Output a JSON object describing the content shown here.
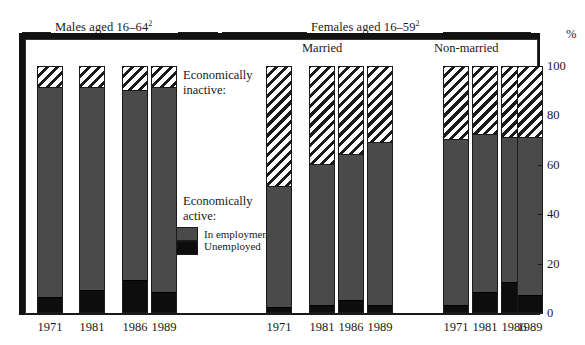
{
  "chart_data": {
    "type": "bar",
    "subtitle": "",
    "xlabel": "",
    "ylabel": "%",
    "ylim": [
      0,
      100
    ],
    "grid": false,
    "stacked": true,
    "legend_position": "inside-left",
    "y_ticks": [
      0,
      20,
      40,
      60,
      80,
      100
    ],
    "y_tick_labels": [
      "0",
      "20",
      "40",
      "60",
      "80",
      "100"
    ],
    "groups": [
      {
        "name": "Males aged 16–64",
        "footnote": "2",
        "label": "Males aged 16–64",
        "subgroups": [
          {
            "name": "",
            "categories": [
              "1971",
              "1981",
              "1986",
              "1989"
            ],
            "series": [
              {
                "name": "Unemployed",
                "values": [
                  6,
                  9,
                  13,
                  8
                ]
              },
              {
                "name": "In employment",
                "values": [
                  85,
                  82,
                  77,
                  83
                ]
              },
              {
                "name": "Economically inactive",
                "values": [
                  9,
                  9,
                  10,
                  9
                ]
              }
            ]
          }
        ]
      },
      {
        "name": "Females aged 16–59",
        "footnote": "2",
        "label": "Females aged 16–59",
        "subgroups": [
          {
            "name": "Married",
            "categories": [
              "1971",
              "1981",
              "1986",
              "1989"
            ],
            "series": [
              {
                "name": "Unemployed",
                "values": [
                  2,
                  3,
                  5,
                  3
                ]
              },
              {
                "name": "In employment",
                "values": [
                  49,
                  57,
                  59,
                  66
                ]
              },
              {
                "name": "Economically inactive",
                "values": [
                  49,
                  40,
                  36,
                  31
                ]
              }
            ]
          },
          {
            "name": "Non-married",
            "categories": [
              "1971",
              "1981",
              "1986",
              "1989"
            ],
            "series": [
              {
                "name": "Unemployed",
                "values": [
                  3,
                  8,
                  12,
                  7
                ]
              },
              {
                "name": "In employment",
                "values": [
                  67,
                  64,
                  59,
                  64
                ]
              },
              {
                "name": "Economically inactive",
                "values": [
                  30,
                  28,
                  29,
                  29
                ]
              }
            ]
          }
        ]
      }
    ],
    "bars": [
      {
        "id": "m1971",
        "group": "Males aged 16–64",
        "subgroup": "",
        "category": "1971",
        "unemployed": 6,
        "employed": 85,
        "inactive": 9,
        "active_total": 91
      },
      {
        "id": "m1981",
        "group": "Males aged 16–64",
        "subgroup": "",
        "category": "1981",
        "unemployed": 9,
        "employed": 82,
        "inactive": 9,
        "active_total": 91
      },
      {
        "id": "m1986",
        "group": "Males aged 16–64",
        "subgroup": "",
        "category": "1986",
        "unemployed": 13,
        "employed": 77,
        "inactive": 10,
        "active_total": 90
      },
      {
        "id": "m1989",
        "group": "Males aged 16–64",
        "subgroup": "",
        "category": "1989",
        "unemployed": 8,
        "employed": 83,
        "inactive": 9,
        "active_total": 91
      },
      {
        "id": "fm1971",
        "group": "Females aged 16–59",
        "subgroup": "Married",
        "category": "1971",
        "unemployed": 2,
        "employed": 49,
        "inactive": 49,
        "active_total": 51
      },
      {
        "id": "fm1981",
        "group": "Females aged 16–59",
        "subgroup": "Married",
        "category": "1981",
        "unemployed": 3,
        "employed": 57,
        "inactive": 40,
        "active_total": 60
      },
      {
        "id": "fm1986",
        "group": "Females aged 16–59",
        "subgroup": "Married",
        "category": "1986",
        "unemployed": 5,
        "employed": 59,
        "inactive": 36,
        "active_total": 64
      },
      {
        "id": "fm1989",
        "group": "Females aged 16–59",
        "subgroup": "Married",
        "category": "1989",
        "unemployed": 3,
        "employed": 66,
        "inactive": 31,
        "active_total": 69
      },
      {
        "id": "fn1971",
        "group": "Females aged 16–59",
        "subgroup": "Non-married",
        "category": "1971",
        "unemployed": 3,
        "employed": 67,
        "inactive": 30,
        "active_total": 70
      },
      {
        "id": "fn1981",
        "group": "Females aged 16–59",
        "subgroup": "Non-married",
        "category": "1981",
        "unemployed": 8,
        "employed": 64,
        "inactive": 28,
        "active_total": 72
      },
      {
        "id": "fn1986",
        "group": "Females aged 16–59",
        "subgroup": "Non-married",
        "category": "1986",
        "unemployed": 12,
        "employed": 59,
        "inactive": 29,
        "active_total": 71
      },
      {
        "id": "fn1989",
        "group": "Females aged 16–59",
        "subgroup": "Non-married",
        "category": "1989",
        "unemployed": 7,
        "employed": 64,
        "inactive": 29,
        "active_total": 71
      }
    ],
    "annotations": [
      {
        "id": "inactive",
        "line1": "Economically",
        "line2": "inactive:"
      },
      {
        "id": "active",
        "line1": "Economically",
        "line2": "active:"
      }
    ],
    "legend": [
      {
        "key": "employed",
        "label": "In employment",
        "footnote": "3",
        "color": "#4a4a4a",
        "pattern": "solid-grey"
      },
      {
        "key": "unemployed",
        "label": "Unemployed",
        "footnote": "",
        "color": "#0d0d0d",
        "pattern": "solid-black"
      }
    ],
    "patterns": {
      "inactive": "diagonal-hatch",
      "employed": "solid-grey",
      "unemployed": "solid-black"
    }
  },
  "headings": {
    "males": "Males aged 16–64",
    "males_footnote": "2",
    "females": "Females aged 16–59",
    "females_footnote": "2",
    "married": "Married",
    "nonmarried": "Non-married",
    "percent": "%"
  },
  "annotations": {
    "inactive_line1": "Economically",
    "inactive_line2": "inactive:",
    "active_line1": "Economically",
    "active_line2": "active:"
  },
  "legend": {
    "employed_label": "In employment",
    "employed_footnote": "3",
    "unemployed_label": "Unemployed"
  },
  "axis": {
    "y_labels": [
      "100",
      "80",
      "60",
      "40",
      "20",
      "0"
    ],
    "x_labels": [
      "1971",
      "1981",
      "1986",
      "1989",
      "1971",
      "1981",
      "1986",
      "1989",
      "1971",
      "1981",
      "1986",
      "1989"
    ]
  },
  "colors": {
    "employed": "#4a4a4a",
    "unemployed": "#0d0d0d",
    "inactive_stroke": "#1a1a1a",
    "frame": "#111111",
    "background": "#ffffff"
  }
}
